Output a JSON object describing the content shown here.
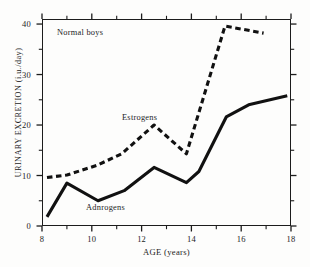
{
  "chart_data": {
    "type": "line",
    "title": "",
    "xlabel": "AGE (years)",
    "ylabel": "URINARY EXCRETION (i.u./day)",
    "xlim": [
      8,
      18
    ],
    "ylim": [
      0,
      41
    ],
    "grid": false,
    "legend_position": "inline-annotations",
    "x_ticks_major": [
      8,
      10,
      12,
      14,
      16,
      18
    ],
    "x_ticks_minor": [
      9,
      11,
      13,
      15,
      17
    ],
    "y_ticks_major": [
      0,
      10,
      20,
      30,
      40
    ],
    "y_ticks_minor": [
      5,
      15,
      25,
      35
    ],
    "annotations": [
      {
        "text": "Normal boys",
        "x": 9.4,
        "y": 38.2
      },
      {
        "text": "Estrogens",
        "x": 12.0,
        "y": 22.5
      },
      {
        "text": "Adnrogens",
        "x": 10.6,
        "y": 4.2
      }
    ],
    "series": [
      {
        "name": "Estrogens",
        "style": "dashed",
        "color": "#111111",
        "points": [
          {
            "x": 8.2,
            "y": 9.6
          },
          {
            "x": 9.0,
            "y": 10.1
          },
          {
            "x": 10.2,
            "y": 12.0
          },
          {
            "x": 11.2,
            "y": 14.3
          },
          {
            "x": 12.5,
            "y": 20.0
          },
          {
            "x": 13.8,
            "y": 14.3
          },
          {
            "x": 15.35,
            "y": 39.6
          },
          {
            "x": 16.9,
            "y": 38.2
          }
        ]
      },
      {
        "name": "Adnrogens",
        "style": "solid",
        "color": "#111111",
        "points": [
          {
            "x": 8.2,
            "y": 1.8
          },
          {
            "x": 9.0,
            "y": 8.5
          },
          {
            "x": 10.25,
            "y": 5.0
          },
          {
            "x": 11.3,
            "y": 7.0
          },
          {
            "x": 12.5,
            "y": 11.6
          },
          {
            "x": 13.8,
            "y": 8.6
          },
          {
            "x": 14.3,
            "y": 10.8
          },
          {
            "x": 15.4,
            "y": 21.6
          },
          {
            "x": 16.3,
            "y": 24.0
          },
          {
            "x": 17.85,
            "y": 25.8
          }
        ]
      }
    ]
  },
  "axes": {
    "x_title": "AGE (years)",
    "y_title": "URINARY EXCRETION (i.u./day)",
    "x_tick_labels": [
      "8",
      "10",
      "12",
      "14",
      "16",
      "18"
    ],
    "y_tick_labels": [
      "0",
      "10",
      "20",
      "30",
      "40"
    ]
  },
  "labels": {
    "normal_boys": "Normal boys",
    "estrogens": "Estrogens",
    "androgens": "Adnrogens"
  }
}
